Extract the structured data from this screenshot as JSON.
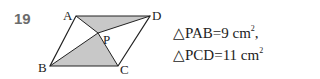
{
  "problem": {
    "number": "19",
    "figure": {
      "type": "parallelogram",
      "vertices": {
        "A": [
          76,
          16
        ],
        "D": [
          150,
          16
        ],
        "B": [
          50,
          66
        ],
        "C": [
          118,
          66
        ]
      },
      "interior_point": {
        "label": "P",
        "coords": [
          98,
          33
        ]
      },
      "labels": {
        "A": "A",
        "B": "B",
        "C": "C",
        "D": "D",
        "P": "P"
      },
      "shaded_triangles": [
        "PAD",
        "PBC"
      ],
      "shade_color": "#c8c8c8",
      "line_color": "#222222"
    },
    "conditions": [
      {
        "triangle": "△PAB",
        "eq": "=9 cm",
        "exp": "2",
        "trail": ","
      },
      {
        "triangle": "△PCD",
        "eq": "=11 cm",
        "exp": "2",
        "trail": ""
      }
    ]
  }
}
